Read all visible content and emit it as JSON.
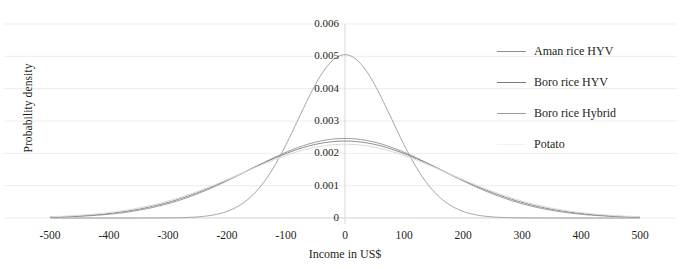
{
  "chart_data": {
    "type": "line",
    "title": "",
    "xlabel": "Income in US$",
    "ylabel": "Probability density",
    "xlim": [
      -500,
      500
    ],
    "ylim": [
      0,
      0.006
    ],
    "xticks": [
      "-500",
      "-400",
      "-300",
      "-200",
      "-100",
      "0",
      "100",
      "200",
      "300",
      "400",
      "500"
    ],
    "xtick_values": [
      -500,
      -400,
      -300,
      -200,
      -100,
      0,
      100,
      200,
      300,
      400,
      500
    ],
    "yticks": [
      "0",
      "0.001",
      "0.002",
      "0.003",
      "0.004",
      "0.005",
      "0.006"
    ],
    "ytick_values": [
      0,
      0.001,
      0.002,
      0.003,
      0.004,
      0.005,
      0.006
    ],
    "grid": "horizontal",
    "legend_position": "right",
    "zero_line": true,
    "series": [
      {
        "name": "Aman rice HYV",
        "color": "#8c8c8c",
        "distribution": "normal",
        "mean": 0,
        "sigma": 162,
        "peak": 0.00246,
        "x": [
          -500,
          -450,
          -400,
          -350,
          -300,
          -250,
          -200,
          -150,
          -100,
          -50,
          0,
          50,
          100,
          150,
          200,
          250,
          300,
          350,
          400,
          450,
          500
        ],
        "values": [
          1.3e-06,
          6e-06,
          2.29e-05,
          7.31e-05,
          0.000196,
          0.000442,
          0.000839,
          0.00134,
          0.0018,
          0.0022,
          0.00246,
          0.0022,
          0.0018,
          0.00134,
          0.000839,
          0.000442,
          0.000196,
          7.31e-05,
          2.29e-05,
          6e-06,
          1.3e-06
        ]
      },
      {
        "name": "Boro rice HYV",
        "color": "#7a7a7a",
        "distribution": "normal",
        "mean": 0,
        "sigma": 168,
        "peak": 0.00238,
        "x": [
          -500,
          -450,
          -400,
          -350,
          -300,
          -250,
          -200,
          -150,
          -100,
          -50,
          0,
          50,
          100,
          150,
          200,
          250,
          300,
          350,
          400,
          450,
          500
        ],
        "values": [
          2.3e-06,
          9.7e-06,
          3.43e-05,
          0.000102,
          0.000256,
          0.000544,
          0.00098,
          0.00149,
          0.00193,
          0.00226,
          0.00238,
          0.00226,
          0.00193,
          0.00149,
          0.00098,
          0.000544,
          0.000256,
          0.000102,
          3.43e-05,
          9.7e-06,
          2.3e-06
        ]
      },
      {
        "name": "Boro rice Hybrid",
        "color": "#9a9a9a",
        "distribution": "normal",
        "mean": 0,
        "sigma": 79,
        "peak": 0.00505,
        "x": [
          -500,
          -450,
          -400,
          -350,
          -300,
          -250,
          -200,
          -150,
          -100,
          -50,
          0,
          50,
          100,
          150,
          200,
          250,
          300,
          350,
          400,
          450,
          500
        ],
        "values": [
          0.0,
          0.0,
          0.0,
          1e-07,
          4e-06,
          4.15e-05,
          0.000205,
          0.000548,
          0.001115,
          0.00206,
          0.00505,
          0.00206,
          0.001115,
          0.000548,
          0.000205,
          4.15e-05,
          4e-06,
          1e-07,
          0.0,
          0.0,
          0.0
        ]
      },
      {
        "name": "Potato",
        "color": "#dcdcdc",
        "distribution": "normal",
        "mean": 0,
        "sigma": 175,
        "peak": 0.00228,
        "x": [
          -500,
          -450,
          -400,
          -350,
          -300,
          -250,
          -200,
          -150,
          -100,
          -50,
          0,
          50,
          100,
          150,
          200,
          250,
          300,
          350,
          400,
          450,
          500
        ],
        "values": [
          4.1e-06,
          1.58e-05,
          5.19e-05,
          0.000144,
          0.000339,
          0.000679,
          0.00116,
          0.00168,
          0.00207,
          0.00227,
          0.00228,
          0.00227,
          0.00207,
          0.00168,
          0.00116,
          0.000679,
          0.000339,
          0.000144,
          5.19e-05,
          1.58e-05,
          4.1e-06
        ]
      }
    ]
  },
  "axis": {
    "ylabel": "Probability density",
    "xlabel": "Income in US$"
  },
  "legend": {
    "items": [
      {
        "label": "Aman rice HYV",
        "color": "#8c8c8c"
      },
      {
        "label": "Boro rice HYV",
        "color": "#7a7a7a"
      },
      {
        "label": "Boro rice Hybrid",
        "color": "#9a9a9a"
      },
      {
        "label": "Potato",
        "color": "#f2f2f2"
      }
    ]
  },
  "style": {
    "grid_color": "#ededed",
    "axis_color": "#d9d9d9",
    "text_color": "#231f20",
    "background": "#ffffff"
  }
}
